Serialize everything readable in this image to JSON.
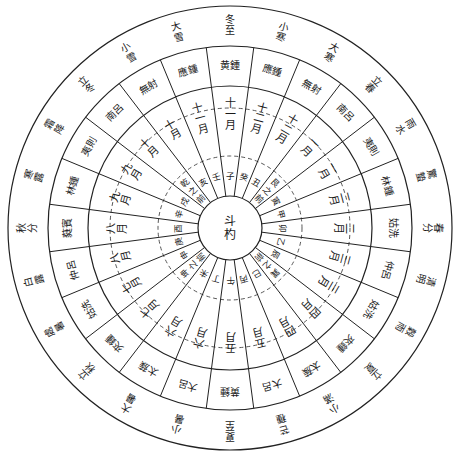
{
  "diagram": {
    "title": "",
    "center_label": "斗杓",
    "colors": {
      "ink": "#222222",
      "background": "#ffffff"
    },
    "geometry": {
      "cx": 230,
      "cy": 228,
      "r_outer": 222,
      "r_terms_inner": 182,
      "r_pipes_inner": 142,
      "r_pipes_dashed": 120,
      "r_months_inner": 72,
      "r_center": 32
    },
    "solar_terms": [
      "冬至",
      "小寒",
      "大寒",
      "立春",
      "雨水",
      "驚蟄",
      "春分",
      "清明",
      "穀雨",
      "立夏",
      "小滿",
      "芒種",
      "夏至",
      "小暑",
      "大暑",
      "立秋",
      "處暑",
      "白露",
      "秋分",
      "寒露",
      "霜降",
      "立冬",
      "小雪",
      "大雪"
    ],
    "pitch_pipes": [
      "黄鍾",
      "應鍾",
      "無射",
      "南呂",
      "夷則",
      "林鍾",
      "姑洗",
      "仲呂",
      "姑洗",
      "夾鍾",
      "太蔟",
      "大呂",
      "黄鍾",
      "大呂",
      "太蔟",
      "夾鍾",
      "姑洗",
      "仲呂",
      "蕤賓",
      "林鍾",
      "夷則",
      "南呂",
      "無射",
      "應鍾"
    ],
    "months": [
      "十一月",
      "十二月",
      "十二月",
      "一月",
      "一月",
      "二月",
      "二月",
      "三月",
      "三月",
      "四月",
      "四月",
      "五月",
      "五月",
      "六月",
      "六月",
      "七月",
      "七月",
      "八月",
      "八月",
      "九月",
      "九月",
      "十月",
      "十月",
      "十一月"
    ],
    "directions": [
      "子",
      "癸",
      "丑",
      "艮之前",
      "寅",
      "甲",
      "卯",
      "乙",
      "辰",
      "巽之前",
      "巳",
      "丙",
      "午",
      "丁",
      "未",
      "坤之前",
      "申",
      "庚",
      "酉",
      "辛",
      "戌",
      "乾之前",
      "亥",
      "壬"
    ]
  }
}
